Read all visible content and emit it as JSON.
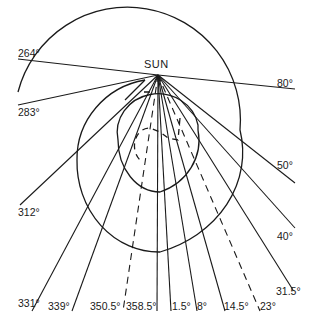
{
  "diagram": {
    "sun_label": "SUN",
    "sun_position": {
      "x": 158,
      "y": 75
    },
    "rays": [
      {
        "label": "264°",
        "x2": 18,
        "y2": 59,
        "lx": 18,
        "ly": 48,
        "dashed": false
      },
      {
        "label": "80°",
        "x2": 295,
        "y2": 89,
        "lx": 277,
        "ly": 78,
        "dashed": false
      },
      {
        "label": "283°",
        "x2": 18,
        "y2": 105,
        "lx": 18,
        "ly": 107,
        "dashed": false
      },
      {
        "label": "312°",
        "x2": 20,
        "y2": 205,
        "lx": 18,
        "ly": 207,
        "dashed": false
      },
      {
        "label": "50°",
        "x2": 295,
        "y2": 183,
        "lx": 277,
        "ly": 160,
        "dashed": false
      },
      {
        "label": "40°",
        "x2": 295,
        "y2": 228,
        "lx": 277,
        "ly": 231,
        "dashed": false
      },
      {
        "label": "331°",
        "x2": 32,
        "y2": 311,
        "lx": 18,
        "ly": 298,
        "dashed": false
      },
      {
        "label": "339°",
        "x2": 72,
        "y2": 311,
        "lx": 48,
        "ly": 301,
        "dashed": false
      },
      {
        "label": "350.5°",
        "x2": 123,
        "y2": 311,
        "lx": 90,
        "ly": 301,
        "dashed": true
      },
      {
        "label": "358.5°",
        "x2": 157,
        "y2": 311,
        "lx": 126,
        "ly": 301,
        "dashed": false
      },
      {
        "label": "1.5°",
        "x2": 171,
        "y2": 311,
        "lx": 172,
        "ly": 301,
        "dashed": false
      },
      {
        "label": "8°",
        "x2": 197,
        "y2": 311,
        "lx": 197,
        "ly": 301,
        "dashed": false
      },
      {
        "label": "14.5°",
        "x2": 225,
        "y2": 311,
        "lx": 224,
        "ly": 301,
        "dashed": false
      },
      {
        "label": "23°",
        "x2": 260,
        "y2": 311,
        "lx": 260,
        "ly": 301,
        "dashed": true
      },
      {
        "label": "31.5°",
        "x2": 293,
        "y2": 290,
        "lx": 276,
        "ly": 286,
        "dashed": false
      }
    ]
  }
}
